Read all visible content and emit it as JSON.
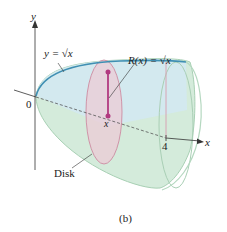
{
  "figure": {
    "caption": "(b)",
    "labels": {
      "y_axis": "y",
      "x_axis": "x",
      "origin": "0",
      "x_tick_4": "4",
      "x_point": "x",
      "curve": "y = √x",
      "radius": "R(x) = √x",
      "disk": "Disk"
    },
    "colors": {
      "solid_fill": "#cfe8d6",
      "solid_edge": "#9cc8aa",
      "top_face": "#cde6ef",
      "curve": "#3a8fb0",
      "disk_fill": "#e8c4cf",
      "disk_edge": "#c98aa0",
      "radius_line": "#b0307a",
      "axis": "#333333"
    }
  }
}
